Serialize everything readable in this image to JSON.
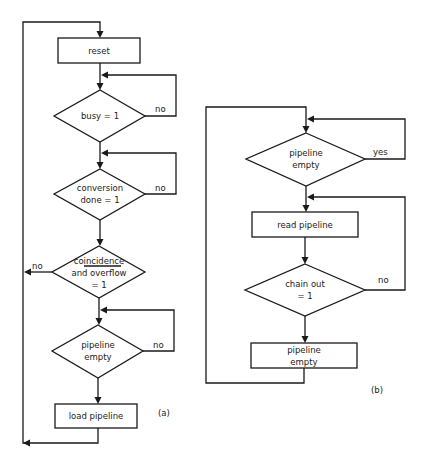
{
  "diagram_a": {
    "caption": "(a)",
    "nodes": [
      {
        "id": "reset",
        "type": "process",
        "lines": [
          "reset"
        ]
      },
      {
        "id": "busy",
        "type": "decision",
        "lines": [
          "busy = 1"
        ],
        "no_label": "no"
      },
      {
        "id": "conversion",
        "type": "decision",
        "lines": [
          "conversion",
          "done = 1"
        ],
        "no_label": "no"
      },
      {
        "id": "coincidence",
        "type": "decision",
        "lines": [
          "coincidence",
          "and overflow",
          "= 1"
        ],
        "no_label": "no"
      },
      {
        "id": "pipeline_empty",
        "type": "decision",
        "lines": [
          "pipeline",
          "empty"
        ],
        "no_label": "no"
      },
      {
        "id": "load_pipeline",
        "type": "process",
        "lines": [
          "load pipeline"
        ]
      }
    ]
  },
  "diagram_b": {
    "caption": "(b)",
    "nodes": [
      {
        "id": "pipeline_empty_check",
        "type": "decision",
        "lines": [
          "pipeline",
          "empty"
        ],
        "yes_label": "yes"
      },
      {
        "id": "read_pipeline",
        "type": "process",
        "lines": [
          "read pipeline"
        ]
      },
      {
        "id": "chain_out",
        "type": "decision",
        "lines": [
          "chain out",
          "= 1"
        ],
        "no_label": "no"
      },
      {
        "id": "pipeline_empty_set",
        "type": "process",
        "lines": [
          "pipeline",
          "empty"
        ]
      }
    ]
  },
  "colors": {
    "line": "#1a1a1a",
    "background": "#ffffff"
  }
}
